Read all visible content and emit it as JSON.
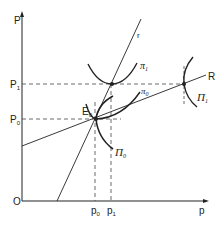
{
  "diagram": {
    "axes": {
      "y_label": "P",
      "x_label": "p",
      "origin_label": "O"
    },
    "y_ticks": [
      {
        "label": "P",
        "sub": "1",
        "y": 84
      },
      {
        "label": "P",
        "sub": "0",
        "y": 119
      }
    ],
    "x_ticks": [
      {
        "label": "p",
        "sub": "0",
        "x": 95
      },
      {
        "label": "p",
        "sub": "1",
        "x": 111
      }
    ],
    "lines": {
      "r_label": "r",
      "R_label": "R"
    },
    "points": {
      "E0_label": "E",
      "E0_sub": "0"
    },
    "curves": {
      "pi1_label": "π",
      "pi1_sub": "1",
      "pi0_label": "π",
      "pi0_sub": "0",
      "Pi0_label": "Π",
      "Pi0_sub": "0",
      "Pi1_label": "Π",
      "Pi1_sub": "1"
    },
    "colors": {
      "ink": "#222222",
      "background": "#ffffff"
    }
  }
}
